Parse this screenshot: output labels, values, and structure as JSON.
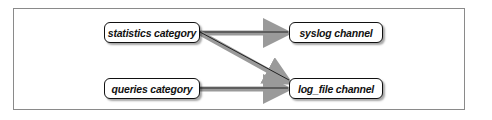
{
  "diagram": {
    "nodes": {
      "statistics": {
        "label": "statistics category"
      },
      "queries": {
        "label": "queries category"
      },
      "syslog": {
        "label": "syslog channel"
      },
      "log_file": {
        "label": "log_file channel"
      }
    },
    "edges": [
      {
        "from": "statistics category",
        "to": "syslog channel"
      },
      {
        "from": "statistics category",
        "to": "log_file channel"
      },
      {
        "from": "queries category",
        "to": "log_file channel"
      }
    ],
    "colors": {
      "arrow_band": "#9a9a9a",
      "arrow_line": "#222222",
      "box_border": "#111111"
    }
  }
}
